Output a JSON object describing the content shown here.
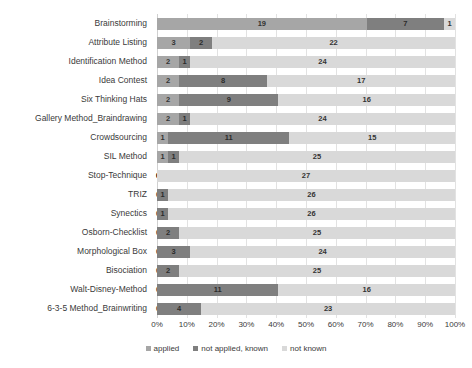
{
  "chart_data": {
    "type": "bar",
    "orientation": "horizontal",
    "stacked": true,
    "title": "",
    "xlabel": "",
    "ylabel": "",
    "xlim": [
      0,
      100
    ],
    "xtick_labels": [
      "0%",
      "10%",
      "20%",
      "30%",
      "40%",
      "50%",
      "60%",
      "70%",
      "80%",
      "90%",
      "100%"
    ],
    "xtick_values": [
      0,
      10,
      20,
      30,
      40,
      50,
      60,
      70,
      80,
      90,
      100
    ],
    "grid": true,
    "legend_position": "bottom",
    "total_per_category": 27,
    "categories": [
      "Brainstorming",
      "Attribute Listing",
      "Identification Method",
      "Idea Contest",
      "Six Thinking Hats",
      "Gallery Method_Braindrawing",
      "Crowdsourcing",
      "SIL Method",
      "Stop-Technique",
      "TRIZ",
      "Synectics",
      "Osborn-Checklist",
      "Morphological Box",
      "Bisociation",
      "Walt-Disney-Method",
      "6-3-5 Method_Brainwriting"
    ],
    "series": [
      {
        "name": "applied",
        "color": "#a6a6a6",
        "values": [
          19,
          3,
          2,
          2,
          2,
          2,
          1,
          1,
          0,
          0,
          0,
          0,
          0,
          0,
          0,
          0
        ]
      },
      {
        "name": "not applied, known",
        "color": "#7f7f7f",
        "values": [
          7,
          2,
          1,
          8,
          9,
          1,
          11,
          1,
          0,
          1,
          1,
          2,
          3,
          2,
          11,
          4
        ]
      },
      {
        "name": "not known",
        "color": "#d9d9d9",
        "values": [
          1,
          22,
          24,
          17,
          16,
          24,
          15,
          25,
          27,
          26,
          26,
          25,
          24,
          25,
          16,
          23
        ]
      }
    ]
  },
  "legend": {
    "items": [
      {
        "label": "applied",
        "color": "#a6a6a6"
      },
      {
        "label": "not applied, known",
        "color": "#7f7f7f"
      },
      {
        "label": "not known",
        "color": "#d9d9d9"
      }
    ]
  }
}
